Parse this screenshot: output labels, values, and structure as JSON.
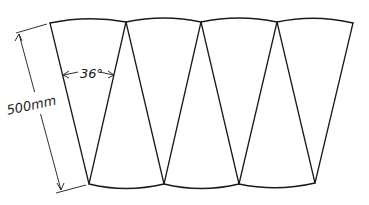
{
  "diagram": {
    "title": "",
    "segments": 7,
    "dimension_length": {
      "label": "500mm",
      "value": 500,
      "unit": "mm"
    },
    "dimension_angle": {
      "label": "36°",
      "value": 36,
      "unit": "deg"
    },
    "colors": {
      "stroke": "#1a1a1a",
      "background": "#ffffff"
    }
  }
}
